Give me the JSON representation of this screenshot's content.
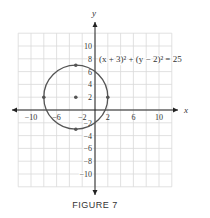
{
  "figure": {
    "caption": "FIGURE 7",
    "equation": "(x + 3)² + (y − 2)² = 25"
  },
  "chart_data": {
    "type": "scatter",
    "title": "",
    "xlabel": "x",
    "ylabel": "y",
    "xlim": [
      -12,
      12
    ],
    "ylim": [
      -12,
      12
    ],
    "grid": true,
    "grid_step": 2,
    "x_ticks": [
      -10,
      -6,
      -2,
      2,
      6,
      10
    ],
    "y_ticks": [
      10,
      8,
      6,
      4,
      2,
      -2,
      -4,
      -6,
      -8,
      -10
    ],
    "curve": {
      "kind": "circle",
      "equation": "(x + 3)^2 + (y - 2)^2 = 25",
      "center": [
        -3,
        2
      ],
      "radius": 5
    },
    "points": [
      {
        "x": -3,
        "y": 2,
        "label": "center"
      },
      {
        "x": -3,
        "y": 7,
        "label": "top"
      },
      {
        "x": -3,
        "y": -3,
        "label": "bottom"
      },
      {
        "x": -8,
        "y": 2,
        "label": "left"
      },
      {
        "x": 2,
        "y": 2,
        "label": "right"
      }
    ],
    "annotations": [
      "(x + 3)² + (y − 2)² = 25"
    ]
  },
  "style": {
    "grid_color": "#d9d9d9",
    "axis_color": "#222222",
    "curve_color": "#555555",
    "point_color": "#555555",
    "text_color": "#333333"
  }
}
